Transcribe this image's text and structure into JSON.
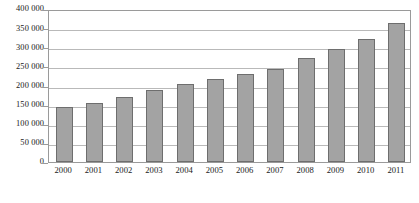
{
  "chart_data": {
    "type": "bar",
    "title": "",
    "subtitle": "",
    "xlabel": "",
    "ylabel": "",
    "categories": [
      "2000",
      "2001",
      "2002",
      "2003",
      "2004",
      "2005",
      "2006",
      "2007",
      "2008",
      "2009",
      "2010",
      "2011"
    ],
    "values": [
      144000,
      155000,
      169000,
      189000,
      205000,
      218000,
      230000,
      244000,
      271000,
      296000,
      322000,
      363000
    ],
    "ylim": [
      0,
      400000
    ],
    "ytick_values": [
      0,
      50000,
      100000,
      150000,
      200000,
      250000,
      300000,
      350000,
      400000
    ],
    "ytick_labels": [
      "0",
      "50 000",
      "100 000",
      "150 000",
      "200 000",
      "250 000",
      "300 000",
      "350 000",
      "400 000"
    ],
    "grid": true,
    "grid_axis": "y",
    "legend": false,
    "legend_position": "none",
    "annotations": [],
    "colors": {
      "bar_fill": "#a3a3a3",
      "bar_border": "#6e6e6e",
      "gridline": "#b9b9b9",
      "axis_line": "#9a9a9a",
      "background": "#ffffff",
      "text": "#1a1a1a"
    }
  }
}
